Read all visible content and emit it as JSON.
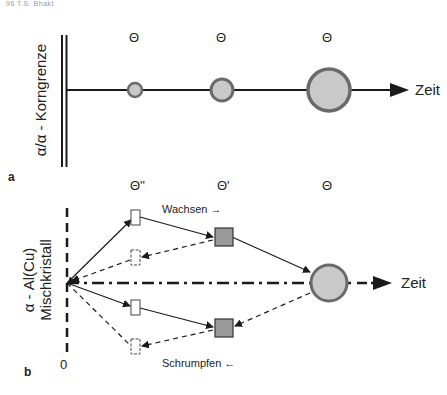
{
  "header": {
    "text": "96    T.S. Bhakt"
  },
  "panel_a": {
    "label": "a",
    "axis_label": "α/α - Korngrenze",
    "time_label": "Zeit",
    "particle_labels": [
      "Θ",
      "Θ",
      "Θ"
    ],
    "particles": [
      {
        "x": 135,
        "r": 7
      },
      {
        "x": 222,
        "r": 11
      },
      {
        "x": 328,
        "r": 22
      }
    ]
  },
  "panel_b": {
    "label": "b",
    "axis_label_line1": "α - Al(Cu)",
    "axis_label_line2": "Mischkristall",
    "origin_label": "0",
    "time_label": "Zeit",
    "phase_labels": [
      "Θ''",
      "Θ'",
      "Θ"
    ],
    "grow_label": "Wachsen →",
    "shrink_label": "Schrumpfen ←"
  },
  "colors": {
    "line": "#1a1a1a",
    "particle_fill": "#c9c9c9",
    "particle_stroke": "#6a6a6a",
    "square_fill": "#9a9a9a"
  }
}
